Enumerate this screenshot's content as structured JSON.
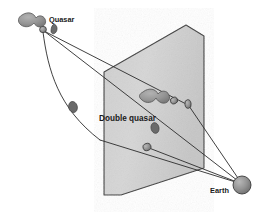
{
  "figure": {
    "kind": "astronomy-diagram",
    "background_color": "#ffffff",
    "width": 274,
    "height": 218
  },
  "labels": {
    "quasar": "Quasar",
    "double_quasar": "Double quasar",
    "earth": "Earth"
  },
  "colors": {
    "plane_fill": "#d0d0d0",
    "plane_edge": "#3a3a3a",
    "galaxy_fill": "#9a9a9a",
    "galaxy_edge": "#4a4a4a",
    "quasar_fill": "#8c8c8c",
    "quasar_edge": "#3c3c3c",
    "lens_fill": "#5e5e5e",
    "earth_fill": "#8a8a8a",
    "earth_edge": "#3a3a3a",
    "ray_stroke": "#2b2b2b",
    "text": "#1a1a1a"
  },
  "objects": {
    "source_galaxy": {
      "name": "quasar-host-galaxy",
      "cx": 31,
      "cy": 22
    },
    "source_quasar": {
      "name": "quasar-source-point",
      "cx": 43,
      "cy": 30
    },
    "source_companion": {
      "name": "quasar-companion-blob",
      "cx": 54,
      "cy": 30
    },
    "lensing_galaxy": {
      "name": "lensing-galaxy",
      "cx": 73,
      "cy": 107
    },
    "image_galaxy": {
      "name": "projected-host-galaxy",
      "cx": 152,
      "cy": 97
    },
    "image_a": {
      "name": "quasar-image-a",
      "cx": 174,
      "cy": 101
    },
    "image_b": {
      "name": "quasar-image-b",
      "cx": 188,
      "cy": 105
    },
    "image_c": {
      "name": "projected-lens-blob",
      "cx": 155,
      "cy": 128
    },
    "image_d": {
      "name": "quasar-image-d",
      "cx": 147,
      "cy": 147
    },
    "earth": {
      "name": "earth-sphere",
      "cx": 242,
      "cy": 185,
      "r": 9
    }
  },
  "plane": {
    "name": "sky-plane",
    "points": "104,72 186,25 204,36 204,168 121,195 104,195"
  },
  "rays": [
    {
      "name": "ray-upper-to-earth",
      "path": "M 44,31 L 242,184"
    },
    {
      "name": "ray-upper-bend",
      "path": "M 44,31 L 190,106"
    },
    {
      "name": "ray-lower-curved",
      "path": "M 43,32 C 48,70 58,108 100,140"
    },
    {
      "name": "ray-lower-to-earth",
      "path": "M 100,140 L 242,184"
    },
    {
      "name": "ray-image-d-earth",
      "path": "M 149,148 L 242,184"
    },
    {
      "name": "ray-image-b-earth",
      "path": "M 189,106 L 242,184"
    }
  ]
}
